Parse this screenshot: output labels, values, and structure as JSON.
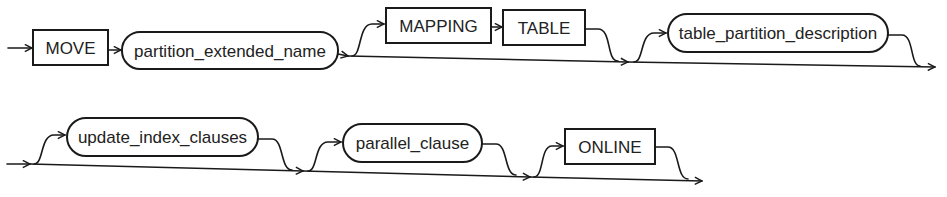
{
  "diagram": {
    "type": "railroad-syntax-diagram",
    "rows": [
      {
        "elements": [
          {
            "kind": "keyword",
            "label": "MOVE",
            "optional": false
          },
          {
            "kind": "nonterminal",
            "label": "partition_extended_name",
            "optional": false
          },
          {
            "kind": "keyword-group",
            "labels": [
              "MAPPING",
              "TABLE"
            ],
            "optional": true
          },
          {
            "kind": "nonterminal",
            "label": "table_partition_description",
            "optional": true
          }
        ]
      },
      {
        "elements": [
          {
            "kind": "nonterminal",
            "label": "update_index_clauses",
            "optional": true
          },
          {
            "kind": "nonterminal",
            "label": "parallel_clause",
            "optional": true
          },
          {
            "kind": "keyword",
            "label": "ONLINE",
            "optional": true
          }
        ]
      }
    ],
    "labels": {
      "move": "MOVE",
      "partition_extended_name": "partition_extended_name",
      "mapping": "MAPPING",
      "table": "TABLE",
      "table_partition_description": "table_partition_description",
      "update_index_clauses": "update_index_clauses",
      "parallel_clause": "parallel_clause",
      "online": "ONLINE"
    },
    "colors": {
      "stroke": "#1a1a1a",
      "text": "#222222",
      "background": "#ffffff"
    }
  }
}
